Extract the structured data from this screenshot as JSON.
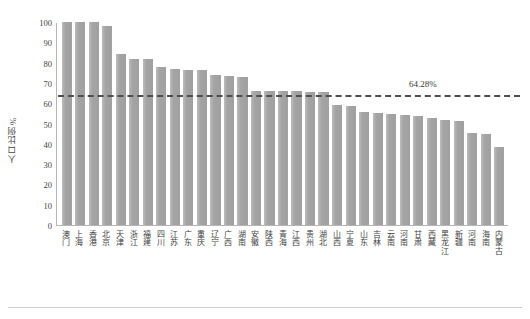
{
  "chart_data": {
    "type": "bar",
    "title": "",
    "xlabel": "",
    "ylabel": "人口比例%",
    "ylim": [
      0,
      100
    ],
    "yticks": [
      0,
      10,
      20,
      30,
      40,
      50,
      60,
      70,
      80,
      90,
      100
    ],
    "grid": false,
    "legend": null,
    "categories": [
      "澳门",
      "上海",
      "香港",
      "北京",
      "天津",
      "浙江",
      "福建",
      "四川",
      "江苏",
      "广东",
      "重庆",
      "辽宁",
      "广西",
      "湖南",
      "安徽",
      "陕西",
      "青海",
      "江西",
      "贵州",
      "湖北",
      "山西",
      "宁夏",
      "山东",
      "吉林",
      "云南",
      "河南",
      "甘肃",
      "西藏",
      "黑龙江",
      "新疆",
      "河南",
      "海南",
      "内蒙古"
    ],
    "values": [
      100,
      100,
      100,
      98,
      84,
      82,
      82,
      78,
      77,
      76.5,
      76.5,
      74,
      73.5,
      73,
      66,
      66,
      66,
      66,
      65.5,
      65.5,
      59,
      58.5,
      55.5,
      55,
      54.5,
      54,
      53.5,
      52.5,
      51.5,
      51,
      45.5,
      45,
      38.5
    ],
    "annotations": [
      {
        "name": "national-average",
        "label": "64.28%",
        "value": 64.28,
        "style": "dashed-horizontal-line",
        "color": "#4e4e4e"
      }
    ],
    "colors": {
      "bar": "#a9a9a9",
      "reference_line": "#4e4e4e",
      "axis": "#b5b5b5",
      "text": "#3f3f3f",
      "background": "#ffffff"
    }
  }
}
